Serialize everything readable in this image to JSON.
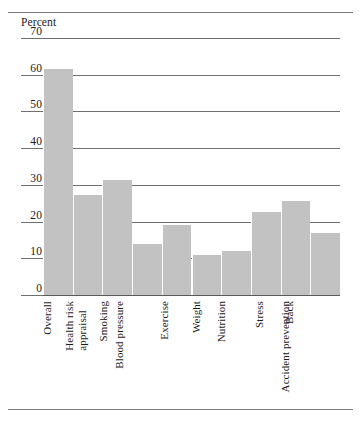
{
  "chart_data": {
    "type": "bar",
    "title": "",
    "subtitle": "",
    "ylabel": "Percent",
    "xlabel": "",
    "ylim": [
      0,
      70
    ],
    "ytick_labels": [
      "0",
      "10",
      "20",
      "30",
      "40",
      "50",
      "60",
      "70"
    ],
    "yticks": [
      0,
      10,
      20,
      30,
      40,
      50,
      60,
      70
    ],
    "grid": true,
    "legend": null,
    "legend_position": "none",
    "bar_color": "#c2c2c2",
    "categories": [
      "Overall",
      "Health risk appraisal",
      "Smoking",
      "Blood pressure",
      "Exercise",
      "Weight",
      "Nutrition",
      "Stress",
      "Back",
      "Accident prevention"
    ],
    "category_lines": [
      [
        "Overall"
      ],
      [
        "Health risk",
        "appraisal"
      ],
      [
        "Smoking"
      ],
      [
        "Blood pressure"
      ],
      [
        "Exercise"
      ],
      [
        "Weight"
      ],
      [
        "Nutrition"
      ],
      [
        "Stress"
      ],
      [
        "Back"
      ],
      [
        "Accident prevention"
      ]
    ],
    "values": [
      61.5,
      27.3,
      31.3,
      14.0,
      19.0,
      10.8,
      12.0,
      22.5,
      25.5,
      16.8
    ]
  }
}
